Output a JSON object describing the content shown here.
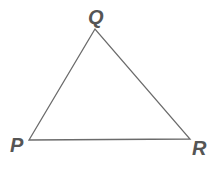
{
  "diagram": {
    "type": "triangle",
    "vertices": [
      {
        "label": "Q",
        "x": 95,
        "y": 29,
        "label_x": 88,
        "label_y": 24
      },
      {
        "label": "P",
        "x": 29,
        "y": 140,
        "label_x": 10,
        "label_y": 152
      },
      {
        "label": "R",
        "x": 190,
        "y": 139,
        "label_x": 192,
        "label_y": 155
      }
    ],
    "stroke_color": "#6b6b6b",
    "label_color": "#555555"
  }
}
